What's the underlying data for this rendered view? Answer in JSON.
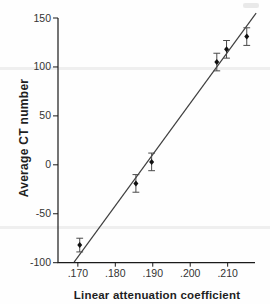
{
  "chart_data": {
    "type": "scatter",
    "title": "",
    "xlabel": "Linear attenuation coefficient",
    "ylabel": "Average CT number",
    "xlim": [
      0.1647,
      0.2173
    ],
    "ylim": [
      -100,
      150
    ],
    "grid": false,
    "legend": "none",
    "x_ticks": [
      {
        "value": 0.17,
        "label": ".170"
      },
      {
        "value": 0.18,
        "label": ".180"
      },
      {
        "value": 0.19,
        "label": ".190"
      },
      {
        "value": 0.2,
        "label": ".200"
      },
      {
        "value": 0.21,
        "label": ".210"
      }
    ],
    "y_ticks": [
      {
        "value": 150,
        "label": "150"
      },
      {
        "value": 100,
        "label": "100"
      },
      {
        "value": 50,
        "label": "50"
      },
      {
        "value": 0,
        "label": "0"
      },
      {
        "value": -50,
        "label": "-50"
      },
      {
        "value": -100,
        "label": "-100"
      }
    ],
    "points": [
      {
        "x": 0.1705,
        "y": -82,
        "y_err": 7
      },
      {
        "x": 0.1855,
        "y": -19,
        "y_err": 9
      },
      {
        "x": 0.1897,
        "y": 3,
        "y_err": 9
      },
      {
        "x": 0.2071,
        "y": 105,
        "y_err": 9
      },
      {
        "x": 0.2097,
        "y": 118,
        "y_err": 9
      },
      {
        "x": 0.2151,
        "y": 131,
        "y_err": 9
      }
    ],
    "fit_line": {
      "x1": 0.169,
      "y1": -99.5,
      "x2": 0.2176,
      "y2": 155
    },
    "marker": "diamond",
    "colors": {
      "axis": "#1a1a1a",
      "fit_line": "#3f3f3f",
      "marker": "#111111",
      "error_bar": "#4a4a4a",
      "tick_label": "#333333",
      "axis_title": "#1f1f1f"
    }
  }
}
